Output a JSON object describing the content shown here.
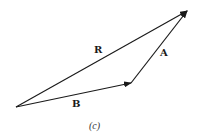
{
  "figure": {
    "caption": "(c)",
    "vectors": [
      {
        "name": "R",
        "label": "R",
        "from": [
          16,
          107
        ],
        "to": [
          187,
          11
        ]
      },
      {
        "name": "B",
        "label": "B",
        "from": [
          16,
          107
        ],
        "to": [
          131,
          83
        ]
      },
      {
        "name": "A",
        "label": "A",
        "from": [
          131,
          83
        ],
        "to": [
          187,
          11
        ]
      }
    ],
    "labels": {
      "R": "R",
      "A": "A",
      "B": "B"
    },
    "colors": {
      "stroke": "#1a1a1a",
      "background": "#ffffff"
    }
  }
}
